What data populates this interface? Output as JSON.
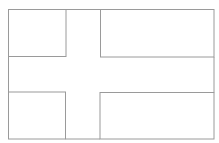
{
  "diagram": {
    "type": "nordic-cross-flag-outline",
    "background": "#ffffff",
    "stroke_color": "#9a9a9a",
    "stroke_width": 1,
    "canvas": {
      "width": 219,
      "height": 143
    },
    "panels": [
      {
        "name": "top-left-panel",
        "x": 8.5,
        "y": 9.5,
        "w": 57.5,
        "h": 47
      },
      {
        "name": "top-right-panel",
        "x": 100.5,
        "y": 9.5,
        "w": 113.5,
        "h": 47.5
      },
      {
        "name": "bottom-left-panel",
        "x": 8.5,
        "y": 92,
        "w": 57,
        "h": 47
      },
      {
        "name": "bottom-right-panel",
        "x": 100,
        "y": 92.5,
        "w": 114,
        "h": 46.5
      }
    ]
  }
}
